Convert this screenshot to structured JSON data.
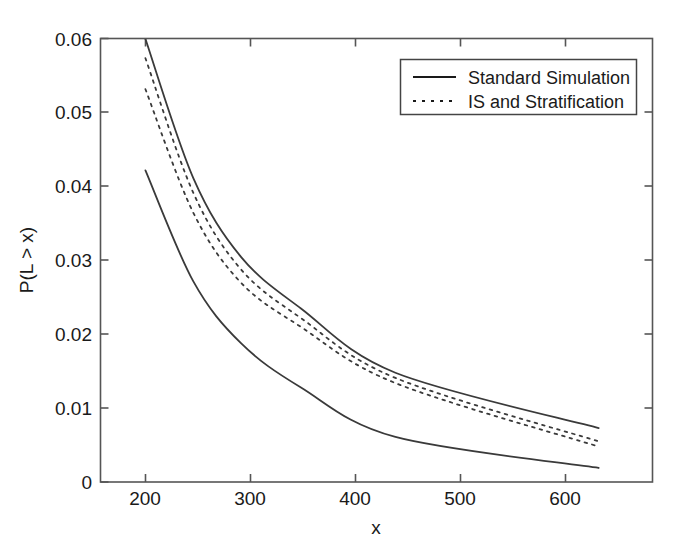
{
  "chart_data": {
    "type": "line",
    "title": "",
    "xlabel": "x",
    "ylabel": "P(L > x)",
    "xlim": [
      157,
      653
    ],
    "ylim": [
      0,
      0.06
    ],
    "xticks": [
      200,
      300,
      400,
      500,
      600
    ],
    "xticklabels": [
      "200",
      "300",
      "400",
      "500",
      "600"
    ],
    "yticks": [
      0,
      0.01,
      0.02,
      0.03,
      0.04,
      0.05,
      0.06
    ],
    "yticklabels": [
      "0",
      "0.01",
      "0.02",
      "0.03",
      "0.04",
      "0.05",
      "0.06"
    ],
    "grid": false,
    "legend_position": "upper right",
    "legend_entries": [
      {
        "label": "Standard Simulation",
        "style": "solid"
      },
      {
        "label": "IS and Stratification",
        "style": "dotted"
      }
    ],
    "x": [
      197,
      240,
      283,
      337,
      422,
      605
    ],
    "series": [
      {
        "name": "Standard Simulation upper bound",
        "style": "solid",
        "values": [
          0.06,
          0.0412,
          0.0305,
          0.0235,
          0.0148,
          0.0073
        ]
      },
      {
        "name": "IS and Stratification upper bound",
        "style": "dotted",
        "values": [
          0.0574,
          0.0392,
          0.0288,
          0.0222,
          0.0141,
          0.0055
        ]
      },
      {
        "name": "IS and Stratification lower bound",
        "style": "dotted",
        "values": [
          0.0532,
          0.0365,
          0.027,
          0.021,
          0.0134,
          0.0048
        ]
      },
      {
        "name": "Standard Simulation lower bound",
        "style": "solid",
        "values": [
          0.0422,
          0.0272,
          0.0188,
          0.0128,
          0.0061,
          0.0019
        ]
      }
    ]
  },
  "axes": {
    "xlabel": "x",
    "ylabel": "P(L > x)",
    "xtick_labels": [
      "200",
      "300",
      "400",
      "500",
      "600"
    ],
    "ytick_labels": [
      "0",
      "0.01",
      "0.02",
      "0.03",
      "0.04",
      "0.05",
      "0.06"
    ]
  },
  "legend": {
    "items": [
      {
        "label": "Standard Simulation"
      },
      {
        "label": "IS and Stratification"
      }
    ]
  },
  "style": {
    "line_color": "#3a3a3a",
    "axis_color": "#555555",
    "background": "#ffffff"
  }
}
